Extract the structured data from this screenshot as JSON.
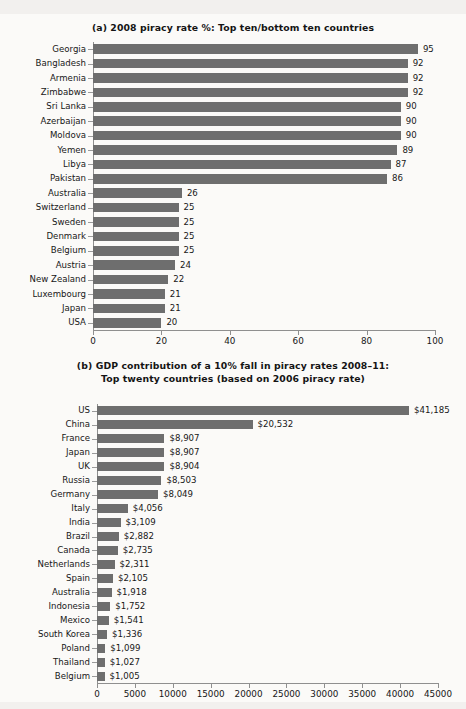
{
  "figure": {
    "background_color": "#f2f0ee",
    "panel_color": "#fbfaf8",
    "bar_color": "#6e6e6e"
  },
  "chart_data": [
    {
      "type": "bar",
      "orientation": "horizontal",
      "panel_label": "(a)",
      "title": "(a) 2008 piracy rate %: Top ten/bottom ten countries",
      "xlabel": "",
      "ylabel": "",
      "xlim": [
        0,
        100
      ],
      "xticks": [
        0,
        20,
        40,
        60,
        80,
        100
      ],
      "xticklabels": [
        "0",
        "20",
        "40",
        "60",
        "80",
        "100"
      ],
      "grid": false,
      "legend": "none",
      "categories": [
        "Georgia",
        "Bangladesh",
        "Armenia",
        "Zimbabwe",
        "Sri Lanka",
        "Azerbaijan",
        "Moldova",
        "Yemen",
        "Libya",
        "Pakistan",
        "Australia",
        "Switzerland",
        "Sweden",
        "Denmark",
        "Belgium",
        "Austria",
        "New Zealand",
        "Luxembourg",
        "Japan",
        "USA"
      ],
      "values": [
        95,
        92,
        92,
        92,
        90,
        90,
        90,
        89,
        87,
        86,
        26,
        25,
        25,
        25,
        25,
        24,
        22,
        21,
        21,
        20
      ],
      "value_labels": [
        "95",
        "92",
        "92",
        "92",
        "90",
        "90",
        "90",
        "89",
        "87",
        "86",
        "26",
        "25",
        "25",
        "25",
        "25",
        "24",
        "22",
        "21",
        "21",
        "20"
      ]
    },
    {
      "type": "bar",
      "orientation": "horizontal",
      "panel_label": "(b)",
      "title": "(b) GDP contribution of a 10% fall in piracy rates 2008–11:",
      "subtitle": "Top twenty countries (based on 2006 piracy rate)",
      "xlabel": "",
      "ylabel": "",
      "xlim": [
        0,
        45000
      ],
      "xticks": [
        0,
        5000,
        10000,
        15000,
        20000,
        25000,
        30000,
        35000,
        40000,
        45000
      ],
      "xticklabels": [
        "0",
        "5000",
        "10000",
        "15000",
        "20000",
        "25000",
        "30000",
        "35000",
        "40000",
        "45000"
      ],
      "grid": false,
      "legend": "none",
      "categories": [
        "US",
        "China",
        "France",
        "Japan",
        "UK",
        "Russia",
        "Germany",
        "Italy",
        "India",
        "Brazil",
        "Canada",
        "Netherlands",
        "Spain",
        "Australia",
        "Indonesia",
        "Mexico",
        "South Korea",
        "Poland",
        "Thailand",
        "Belgium"
      ],
      "values": [
        41185,
        20532,
        8907,
        8907,
        8904,
        8503,
        8049,
        4056,
        3109,
        2882,
        2735,
        2311,
        2105,
        1918,
        1752,
        1541,
        1336,
        1099,
        1027,
        1005
      ],
      "value_labels": [
        "$41,185",
        "$20,532",
        "$8,907",
        "$8,907",
        "$8,904",
        "$8,503",
        "$8,049",
        "$4,056",
        "$3,109",
        "$2,882",
        "$2,735",
        "$2,311",
        "$2,105",
        "$1,918",
        "$1,752",
        "$1,541",
        "$1,336",
        "$1,099",
        "$1,027",
        "$1,005"
      ]
    }
  ]
}
